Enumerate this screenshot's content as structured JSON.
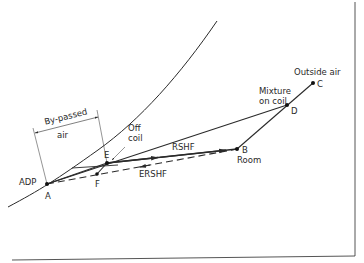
{
  "diagram": {
    "type": "psychrometric-process",
    "curve_label": "",
    "points": {
      "A": {
        "label": "A",
        "x": 47,
        "y": 184
      },
      "E": {
        "label": "E",
        "x": 107,
        "y": 163
      },
      "F": {
        "label": "F",
        "x": 97,
        "y": 174
      },
      "B": {
        "label": "B",
        "x": 237,
        "y": 149
      },
      "D": {
        "label": "D",
        "x": 287,
        "y": 105
      },
      "C": {
        "label": "C",
        "x": 313,
        "y": 83
      }
    },
    "labels": {
      "adp": "ADP",
      "bypassed_line1": "By-passed",
      "bypassed_line2": "air",
      "off_coil_line1": "Off",
      "off_coil_line2": "coil",
      "rshf": "RSHF",
      "ershf": "ERSHF",
      "room": "Room",
      "mixture_line1": "Mixture",
      "mixture_line2": "on coil",
      "outside_air": "Outside air"
    },
    "lines": [
      {
        "from": "A",
        "to": "D",
        "style": "solid"
      },
      {
        "from": "C",
        "to": "B",
        "style": "solid"
      },
      {
        "from": "E",
        "to": "B",
        "style": "solid",
        "label": "RSHF"
      },
      {
        "from": "A",
        "to": "B",
        "style": "dashed",
        "label": "ERSHF"
      },
      {
        "from": "E",
        "to": "F",
        "style": "solid"
      }
    ]
  }
}
